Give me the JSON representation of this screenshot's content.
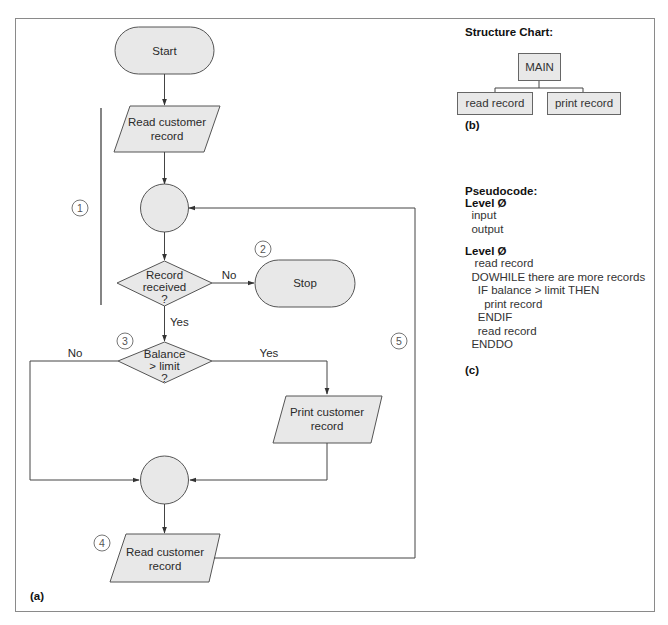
{
  "flowchart": {
    "panel_label": "(a)",
    "start": "Start",
    "read1_line1": "Read customer",
    "read1_line2": "record",
    "decision1_line1": "Record",
    "decision1_line2": "received",
    "decision1_line3": "?",
    "decision1_no": "No",
    "decision1_yes": "Yes",
    "stop": "Stop",
    "decision2_line1": "Balance",
    "decision2_line2": "> limit",
    "decision2_line3": "?",
    "decision2_no": "No",
    "decision2_yes": "Yes",
    "print_line1": "Print customer",
    "print_line2": "record",
    "read2_line1": "Read customer",
    "read2_line2": "record",
    "markers": [
      "1",
      "2",
      "3",
      "4",
      "5"
    ],
    "colors": {
      "fill": "#e8e8e8",
      "stroke": "#555555"
    }
  },
  "structure_chart": {
    "title": "Structure Chart:",
    "root": "MAIN",
    "children": [
      "read record",
      "print record"
    ],
    "panel_label": "(b)"
  },
  "pseudocode": {
    "title": "Pseudocode:",
    "level0_title": "Level Ø",
    "level0_lines": [
      "  input",
      "  output"
    ],
    "level1_title": "Level Ø",
    "level1_lines": [
      "   read record",
      "  DOWHILE there are more records",
      "    IF balance > limit THEN",
      "      print record",
      "    ENDIF",
      "    read record",
      "  ENDDO"
    ],
    "panel_label": "(c)"
  }
}
